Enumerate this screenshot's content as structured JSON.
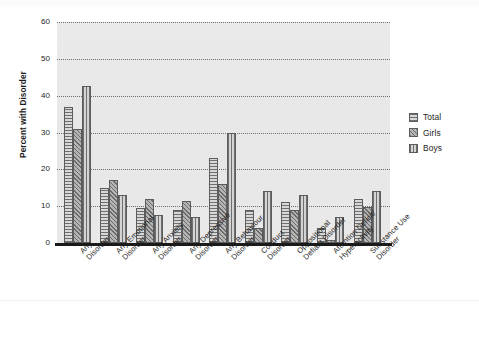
{
  "chart_data": {
    "type": "bar",
    "title": "",
    "subtitle": "",
    "xlabel": "",
    "ylabel": "Percent with Disorder",
    "ylim": [
      0,
      60
    ],
    "yticks": [
      0,
      10,
      20,
      30,
      40,
      50,
      60
    ],
    "ytick_labels": [
      "0",
      "10",
      "20",
      "30",
      "40",
      "50",
      "60"
    ],
    "grid": true,
    "grid_style": "dotted-horizontal",
    "legend_position": "right",
    "orientation": "vertical",
    "grouping": "grouped",
    "categories": [
      "Any Disorder",
      "Any Emotional Disorder",
      "Any Anxiety Disorder",
      "Any Depressive Disorder",
      "Any Behaviour Disorder",
      "Conduct Disorder",
      "Oppositional Defiant Disorder",
      "Attention Deficit/ Hyperactivity",
      "Substance Use Disorder"
    ],
    "category_lines": [
      [
        "Any",
        "Disorder"
      ],
      [
        "Any Emotional",
        "Disorder"
      ],
      [
        "Any Anxiety",
        "Disorder"
      ],
      [
        "Any Depressive",
        "Disorder"
      ],
      [
        "Any Behaviour",
        "Disorder"
      ],
      [
        "Conduct",
        "Disorder"
      ],
      [
        "Oppositional",
        "Defiant Disorder"
      ],
      [
        "Attention Deficit/",
        "Hyperactivity"
      ],
      [
        "Substance Use",
        "Disorder"
      ]
    ],
    "series": [
      {
        "name": "Total",
        "pattern": "horizontal-stripes",
        "color": "#9a9a9a",
        "values": [
          37,
          15,
          9.5,
          9,
          23,
          9,
          11,
          4,
          12
        ]
      },
      {
        "name": "Girls",
        "pattern": "diagonal-hatch",
        "color": "#9a9a9a",
        "values": [
          31,
          17,
          12,
          11.5,
          16,
          4,
          9,
          0.7,
          9.7
        ]
      },
      {
        "name": "Boys",
        "pattern": "vertical-stripes",
        "color": "#9a9a9a",
        "values": [
          42.5,
          13,
          7.5,
          7,
          30,
          14,
          13,
          7,
          14
        ]
      }
    ]
  },
  "legend": {
    "entries": [
      {
        "label": "Total",
        "pattern": "horizontal-stripes"
      },
      {
        "label": "Girls",
        "pattern": "diagonal-hatch"
      },
      {
        "label": "Boys",
        "pattern": "vertical-stripes"
      }
    ]
  },
  "colors": {
    "plot_background": "#e9e9e9",
    "page_background": "#ffffff",
    "gridline": "#6e6e6e",
    "axis": "#1a1a1a",
    "text": "#1d1d1d"
  }
}
